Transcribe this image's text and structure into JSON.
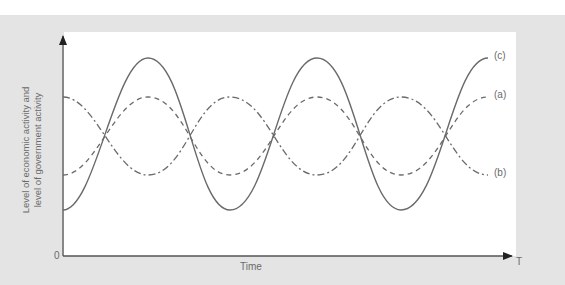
{
  "diagram": {
    "y_axis_label_line1": "Level of economic activity and",
    "y_axis_label_line2": "level of government activity",
    "x_axis_label": "Time",
    "origin_label": "0",
    "x_axis_end_label": "T",
    "curves": [
      {
        "label": "(c)",
        "style": "solid",
        "description": "large-amplitude cycle"
      },
      {
        "label": "(a)",
        "style": "dashed",
        "description": "smaller cycle in phase with (c)"
      },
      {
        "label": "(b)",
        "style": "dash-dot",
        "description": "cycle in opposite phase"
      }
    ],
    "colors": {
      "line": "#6a6a6a",
      "panel": "#e4e4e4",
      "plot": "#ffffff",
      "axis": "#555555"
    }
  }
}
